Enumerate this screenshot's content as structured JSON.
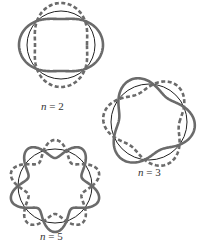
{
  "figures": [
    {
      "id": "n2",
      "label_var": "n",
      "label_rest": " = 2",
      "n": 2,
      "center": [
        61,
        45
      ],
      "radius": 34,
      "amplitude": 8,
      "phase_solid_deg": 0,
      "label_pos": [
        41,
        100
      ]
    },
    {
      "id": "n3",
      "label_var": "n",
      "label_rest": " = 3",
      "n": 3,
      "center": [
        149,
        122
      ],
      "radius": 38,
      "amplitude": 8,
      "phase_solid_deg": 20,
      "label_pos": [
        138,
        166
      ]
    },
    {
      "id": "n5",
      "label_var": "n",
      "label_rest": " = 5",
      "n": 5,
      "center": [
        55,
        186
      ],
      "radius": 37,
      "amplitude": 9,
      "phase_solid_deg": 90,
      "label_pos": [
        40,
        230
      ]
    }
  ],
  "colors": {
    "thin_circle": "#222222",
    "wave": "#6b6b6b"
  }
}
